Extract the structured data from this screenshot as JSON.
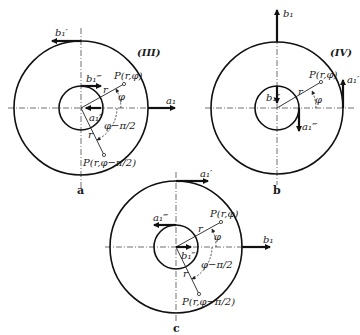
{
  "figures": [
    {
      "id": "a",
      "caption": "a",
      "case": "(III)",
      "vectors": {
        "outer_top": "b₁′",
        "outer_right": "a₁",
        "inner_top": "b₁‴",
        "inner_center": "a₁″"
      },
      "points": {
        "p1": "P(r,φ)",
        "p2": "P(r,φ−π/2)"
      },
      "angles": {
        "phi": "φ",
        "phi_minus": "φ−π/2"
      },
      "radius": "r"
    },
    {
      "id": "b",
      "caption": "b",
      "case": "(IV)",
      "vectors": {
        "outer_top": "b₁",
        "outer_right": "a₁′",
        "inner_top": "b₁″",
        "inner_right": "a₁‴"
      },
      "points": {
        "p1": "P(r,φ)"
      },
      "angles": {
        "phi": "φ"
      },
      "radius": "r"
    },
    {
      "id": "c",
      "caption": "c",
      "vectors": {
        "outer_top": "a₁′",
        "outer_right": "b₁",
        "inner_top": "a₁‴",
        "inner_center": "b₁″"
      },
      "points": {
        "p1": "P(r,φ)",
        "p2": "P(r,φ−π/2)"
      },
      "angles": {
        "phi": "φ",
        "phi_minus": "φ−π/2"
      },
      "radius": "r"
    }
  ]
}
